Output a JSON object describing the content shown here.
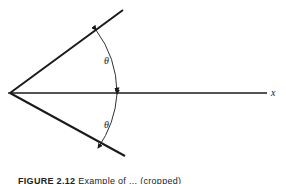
{
  "diagram": {
    "axis_label": "x",
    "angle_label_upper": "θ",
    "angle_label_lower": "θ",
    "colors": {
      "line": "#1a1a1a",
      "background": "#ffffff"
    }
  },
  "caption": {
    "figure_number": "FIGURE 2.12",
    "text": "Example of ... (cropped)"
  }
}
